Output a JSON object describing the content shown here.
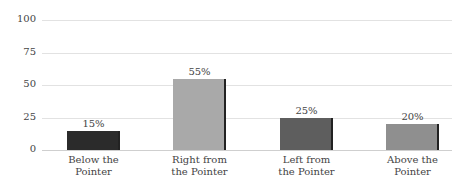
{
  "chart_data": {
    "type": "bar",
    "title": "",
    "xlabel": "",
    "ylabel": "",
    "ylim": [
      0,
      100
    ],
    "yticks": [
      "0",
      "25",
      "50",
      "75",
      "100"
    ],
    "grid": true,
    "legend": null,
    "categories": [
      "Below the Pointer",
      "Right from the Pointer",
      "Left from the Pointer",
      "Above the Pointer"
    ],
    "category_lines": [
      [
        "Below the",
        "Pointer"
      ],
      [
        "Right from",
        "the Pointer"
      ],
      [
        "Left from",
        "the Pointer"
      ],
      [
        "Above the",
        "Pointer"
      ]
    ],
    "values": [
      15,
      55,
      25,
      20
    ],
    "value_labels": [
      "15%",
      "55%",
      "25%",
      "20%"
    ],
    "colors": [
      "#2b2b2b",
      "#a9a9a9",
      "#5e5e5e",
      "#8f8f8f"
    ]
  }
}
